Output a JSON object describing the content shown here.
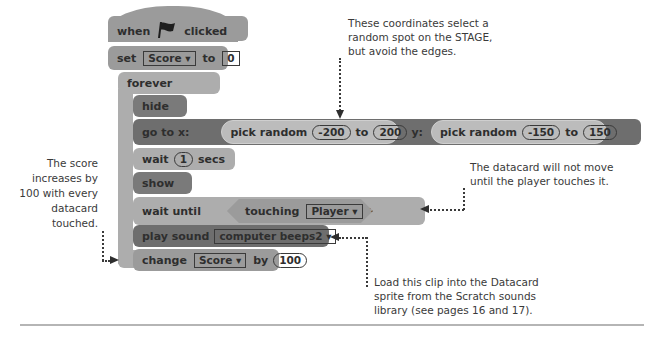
{
  "script": {
    "when_flag": {
      "prefix": "when",
      "icon": "green-flag-icon",
      "suffix": "clicked"
    },
    "set_var": {
      "label": "set",
      "variable": "Score ▾",
      "to": "to",
      "value": "0"
    },
    "forever": {
      "label": "forever",
      "loop_icon": "↲"
    },
    "hide": {
      "label": "hide"
    },
    "goto": {
      "label": "go to x:",
      "x_reporter": {
        "label": "pick random",
        "from": "-200",
        "to_label": "to",
        "to": "200"
      },
      "y_label": "y:",
      "y_reporter": {
        "label": "pick random",
        "from": "-150",
        "to_label": "to",
        "to": "150"
      }
    },
    "wait": {
      "label": "wait",
      "value": "1",
      "unit": "secs"
    },
    "show": {
      "label": "show"
    },
    "wait_until": {
      "label": "wait until",
      "condition": {
        "label": "touching",
        "target": "Player ▾",
        "suffix": "?"
      }
    },
    "play_sound": {
      "label": "play sound",
      "sound": "computer beeps2 ▾"
    },
    "change_var": {
      "label": "change",
      "variable": "Score ▾",
      "by": "by",
      "value": "100"
    }
  },
  "annotations": {
    "coordinates": [
      "These coordinates select a",
      "random spot on the STAGE,",
      "but avoid the edges."
    ],
    "score": [
      "The score",
      "increases by",
      "100 with every",
      "datacard",
      "touched."
    ],
    "datacard": [
      "The datacard will not move",
      "until the player touches it."
    ],
    "sound": [
      "Load this clip into the Datacard",
      "sprite from the Scratch sounds",
      "library (see pages 16 and 17)."
    ]
  },
  "colors": {
    "block_light": "#adadad",
    "block_mid": "#9b9b9b",
    "block_dark": "#7a7a7a",
    "text": "#2e2e2e",
    "divider": "#b5b5b5"
  }
}
